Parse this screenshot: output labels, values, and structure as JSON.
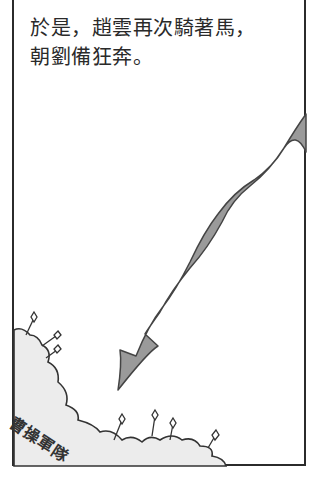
{
  "narration": {
    "line1": "於是，趙雲再次騎著馬，",
    "line2": "朝劉備狂奔。"
  },
  "army": {
    "label": "曹操軍隊"
  },
  "colors": {
    "frame": "#2b2b2b",
    "arrow_fill": "#9a9a9a",
    "arrow_stroke": "#444444",
    "army_fill": "#ececec"
  },
  "icons": {
    "arrow": "curved-arrow-down-left",
    "spears": "spear-tips"
  }
}
